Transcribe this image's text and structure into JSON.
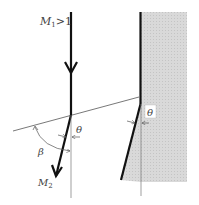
{
  "diagram": {
    "labels": {
      "upstream_mach": "M",
      "upstream_mach_sub": "1",
      "upstream_condition": ">1",
      "downstream_mach": "M",
      "downstream_mach_sub": "2",
      "wave_angle": "β",
      "deflection_angle_flow": "θ",
      "deflection_angle_wall": "θ"
    },
    "colors": {
      "wall_fill": "#d6d6d6",
      "line": "#111111",
      "thin_line": "#666666",
      "label": "#444444"
    }
  }
}
